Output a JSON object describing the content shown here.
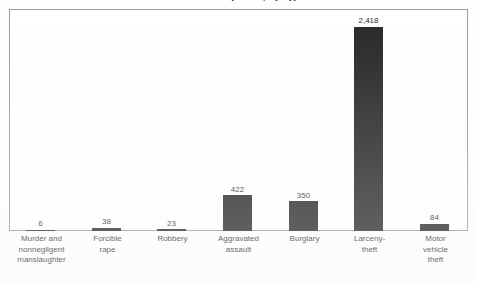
{
  "chart_data": {
    "type": "bar",
    "title": "Offenses Reported, by Type",
    "subtitle": "",
    "xlabel": "",
    "ylabel": "",
    "ylim": [
      0,
      2630
    ],
    "grid": false,
    "legend": false,
    "legend_position": "none",
    "orientation": "vertical",
    "bar_color": "#232323",
    "frame_color": "#9a9a9a",
    "background_color": "#ffffff",
    "categories": [
      "Murder and nonnegligent manslaughter",
      "Forcible rape",
      "Robbery",
      "Aggravated assault",
      "Burglary",
      "Larceny-theft",
      "Motor vehicle theft"
    ],
    "values": [
      6,
      38,
      23,
      422,
      350,
      2418,
      84
    ],
    "value_labels": [
      "6",
      "38",
      "23",
      "422",
      "350",
      "2,418",
      "84"
    ],
    "category_lines": [
      [
        "Murder and",
        "nonnegligent",
        "manslaughter"
      ],
      [
        "Forcible",
        "rape"
      ],
      [
        "Robbery"
      ],
      [
        "Aggravated",
        "assault"
      ],
      [
        "Burglary"
      ],
      [
        "Larceny-",
        "theft"
      ],
      [
        "Motor",
        "vehicle",
        "theft"
      ]
    ],
    "tick_labels": [],
    "annotations": []
  }
}
